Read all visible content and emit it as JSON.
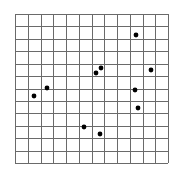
{
  "grid": {
    "left": 15,
    "top": 14,
    "right": 168,
    "bottom": 163,
    "columns": 12,
    "rows": 12,
    "line_color": "#6a6a6a",
    "line_width": 1
  },
  "points": {
    "color": "#000000",
    "radius": 2.4,
    "items": [
      {
        "x": 136,
        "y": 35
      },
      {
        "x": 151,
        "y": 70
      },
      {
        "x": 101,
        "y": 68
      },
      {
        "x": 96,
        "y": 73
      },
      {
        "x": 47,
        "y": 88
      },
      {
        "x": 34,
        "y": 96
      },
      {
        "x": 135,
        "y": 90
      },
      {
        "x": 138,
        "y": 108
      },
      {
        "x": 84,
        "y": 127
      },
      {
        "x": 100,
        "y": 134
      }
    ]
  }
}
